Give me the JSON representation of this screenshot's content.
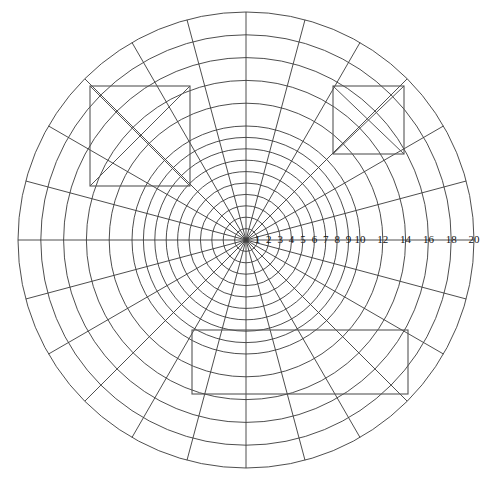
{
  "figure": {
    "background_color": "#ffffff",
    "line_color": "#3a3a3a",
    "rect_color": "#555555",
    "label_color": "#111111",
    "width": 504,
    "height": 479
  },
  "chart_data": {
    "type": "line",
    "plot_kind": "polar-grid",
    "title": "",
    "subtitle": "",
    "xlabel": "",
    "ylabel": "",
    "grid": true,
    "legend": null,
    "center": {
      "x": 246,
      "y": 240
    },
    "outer_radius_px": 228,
    "pixels_per_unit": 11.4,
    "radial_axis": {
      "min": 0,
      "max": 20,
      "tick_values": [
        1,
        2,
        3,
        4,
        5,
        6,
        7,
        8,
        9,
        10,
        12,
        14,
        16,
        18,
        20
      ],
      "tick_labels": [
        "1",
        "2",
        "3",
        "4",
        "5",
        "6",
        "7",
        "8",
        "9",
        "10",
        "12",
        "14",
        "16",
        "18",
        "20"
      ],
      "label_angle_deg": 0,
      "label_side": "right"
    },
    "circles": {
      "radii_units": [
        1,
        2,
        3,
        4,
        5,
        6,
        7,
        8,
        9,
        10,
        12,
        14,
        16,
        18,
        20
      ],
      "count": 15
    },
    "spokes": {
      "angle_step_deg": 15,
      "count": 24,
      "angles_deg": [
        0,
        15,
        30,
        45,
        60,
        75,
        90,
        105,
        120,
        135,
        150,
        165,
        180,
        195,
        210,
        225,
        240,
        255,
        270,
        285,
        300,
        315,
        330,
        345
      ]
    },
    "rectangles": [
      {
        "name": "top-left-box",
        "x": 90,
        "y": 86,
        "width": 100,
        "height": 100,
        "diagonals": true
      },
      {
        "name": "top-right-box",
        "x": 333,
        "y": 86,
        "width": 71,
        "height": 68,
        "diagonals": true
      },
      {
        "name": "bottom-box",
        "x": 192,
        "y": 330,
        "width": 216,
        "height": 64,
        "diagonals": false
      }
    ],
    "annotations": []
  }
}
